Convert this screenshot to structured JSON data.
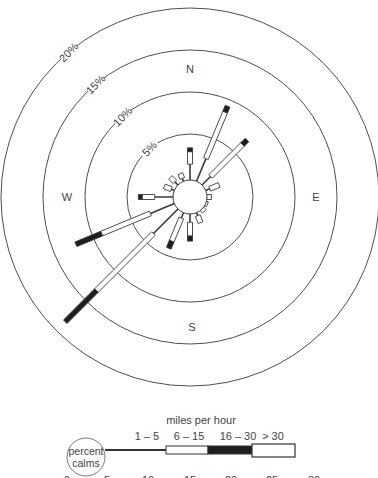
{
  "chart_data": {
    "type": "wind-rose",
    "title": "",
    "center": [
      190,
      197
    ],
    "px_per_percent": 12.6,
    "calm_radius_px": 17,
    "rings": [
      {
        "percent": 5,
        "label": "5%",
        "r": 63
      },
      {
        "percent": 10,
        "label": "10%",
        "r": 105
      },
      {
        "percent": 15,
        "label": "15%",
        "r": 147
      },
      {
        "percent": 20,
        "label": "20%",
        "r": 189
      }
    ],
    "directions": [
      {
        "label": "N",
        "x": 190,
        "y": 73
      },
      {
        "label": "E",
        "x": 316,
        "y": 201
      },
      {
        "label": "S",
        "x": 192,
        "y": 331
      },
      {
        "label": "W",
        "x": 67,
        "y": 201
      }
    ],
    "speed_classes": [
      "1 – 5",
      "6 – 15",
      "16 – 30",
      "> 30"
    ],
    "petals": [
      {
        "dir": "N",
        "angle": 0,
        "segments": [
          2.6,
          1.0,
          0.3,
          0
        ]
      },
      {
        "dir": "NNE",
        "angle": 22.5,
        "segments": [
          3.3,
          4.0,
          0.5,
          0
        ]
      },
      {
        "dir": "NE",
        "angle": 45,
        "segments": [
          2.3,
          3.6,
          0.5,
          0
        ]
      },
      {
        "dir": "ENE",
        "angle": 67.5,
        "segments": [
          1.7,
          0.8,
          0,
          0
        ]
      },
      {
        "dir": "E",
        "angle": 90,
        "segments": [
          1.3,
          0.4,
          0,
          0
        ]
      },
      {
        "dir": "ESE",
        "angle": 112.5,
        "segments": [
          1.2,
          0.3,
          0,
          0
        ]
      },
      {
        "dir": "SE",
        "angle": 135,
        "segments": [
          1.2,
          0.4,
          0,
          0
        ]
      },
      {
        "dir": "SSE",
        "angle": 157.5,
        "segments": [
          1.6,
          0.6,
          0,
          0
        ]
      },
      {
        "dir": "S",
        "angle": 180,
        "segments": [
          2.0,
          1.1,
          0.4,
          0
        ]
      },
      {
        "dir": "SSW",
        "angle": 202.5,
        "segments": [
          1.8,
          2.0,
          0.6,
          0
        ]
      },
      {
        "dir": "SW",
        "angle": 225,
        "segments": [
          4.1,
          6.4,
          3.5,
          0
        ]
      },
      {
        "dir": "WSW",
        "angle": 247.5,
        "segments": [
          3.4,
          4.2,
          2.2,
          0
        ]
      },
      {
        "dir": "W",
        "angle": 270,
        "segments": [
          2.8,
          1.0,
          0.3,
          0
        ]
      },
      {
        "dir": "WNW",
        "angle": 292.5,
        "segments": [
          1.6,
          0.6,
          0,
          0
        ]
      },
      {
        "dir": "NW",
        "angle": 315,
        "segments": [
          1.7,
          0.5,
          0,
          0
        ]
      },
      {
        "dir": "NNW",
        "angle": 337.5,
        "segments": [
          1.6,
          0.4,
          0,
          0
        ]
      }
    ],
    "legend": {
      "title": "miles per hour",
      "calm_label_1": "percent",
      "calm_label_2": "calms",
      "classes": [
        "1 – 5",
        "6 – 15",
        "16 – 30",
        "> 30"
      ],
      "scale_ticks": [
        "0",
        "5",
        "10",
        "15",
        "20",
        "25",
        "30"
      ]
    }
  },
  "colors": {
    "line": "#3a3a3a",
    "dark": "#1e1e1e",
    "text": "#444444",
    "background": "#ffffff"
  }
}
